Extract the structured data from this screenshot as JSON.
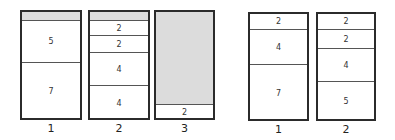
{
  "diagram": {
    "type": "bin-packing",
    "groups": [
      {
        "name": "left",
        "bins": [
          {
            "label": "1",
            "x": 20,
            "y": 10,
            "w": 62,
            "h": 110,
            "segments": [
              {
                "kind": "empty",
                "top": 0,
                "height": 10,
                "text": ""
              },
              {
                "kind": "item",
                "top": 10,
                "height": 42,
                "text": "5"
              },
              {
                "kind": "item",
                "top": 52,
                "height": 58,
                "text": "7"
              }
            ]
          },
          {
            "label": "2",
            "x": 88,
            "y": 10,
            "w": 62,
            "h": 110,
            "segments": [
              {
                "kind": "empty",
                "top": 0,
                "height": 10,
                "text": ""
              },
              {
                "kind": "item",
                "top": 10,
                "height": 15,
                "text": "2"
              },
              {
                "kind": "item",
                "top": 25,
                "height": 17,
                "text": "2"
              },
              {
                "kind": "item",
                "top": 42,
                "height": 33,
                "text": "4"
              },
              {
                "kind": "item",
                "top": 75,
                "height": 35,
                "text": "4"
              }
            ]
          },
          {
            "label": "3",
            "x": 154,
            "y": 10,
            "w": 61,
            "h": 110,
            "segments": [
              {
                "kind": "empty",
                "top": 0,
                "height": 94,
                "text": ""
              },
              {
                "kind": "item",
                "top": 94,
                "height": 16,
                "text": "2"
              }
            ]
          }
        ]
      },
      {
        "name": "right",
        "bins": [
          {
            "label": "1",
            "x": 248,
            "y": 12,
            "w": 61,
            "h": 109,
            "segments": [
              {
                "kind": "item",
                "top": 0,
                "height": 17,
                "text": "2"
              },
              {
                "kind": "item",
                "top": 17,
                "height": 35,
                "text": "4"
              },
              {
                "kind": "item",
                "top": 52,
                "height": 57,
                "text": "7"
              }
            ]
          },
          {
            "label": "2",
            "x": 316,
            "y": 12,
            "w": 60,
            "h": 109,
            "segments": [
              {
                "kind": "item",
                "top": 0,
                "height": 17,
                "text": "2"
              },
              {
                "kind": "item",
                "top": 17,
                "height": 19,
                "text": "2"
              },
              {
                "kind": "item",
                "top": 36,
                "height": 33,
                "text": "4"
              },
              {
                "kind": "item",
                "top": 69,
                "height": 40,
                "text": "5"
              }
            ]
          }
        ]
      }
    ]
  }
}
